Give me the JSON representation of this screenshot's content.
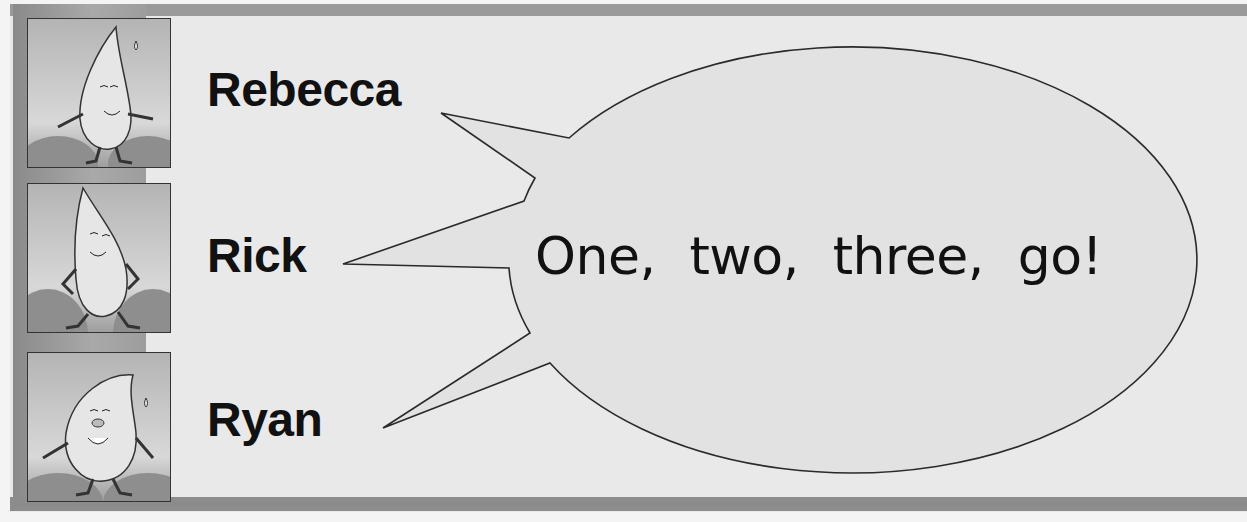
{
  "characters": [
    {
      "name": "Rebecca",
      "icon": "water-drop-character-icon"
    },
    {
      "name": "Rick",
      "icon": "water-drop-character-icon"
    },
    {
      "name": "Ryan",
      "icon": "water-drop-character-icon"
    }
  ],
  "speech_bubble": {
    "text": "One, two, three, go!"
  },
  "colors": {
    "frame_bar": "#9a9a9a",
    "background": "#efefef",
    "bubble_fill": "#e2e2e2",
    "text": "#111111"
  }
}
